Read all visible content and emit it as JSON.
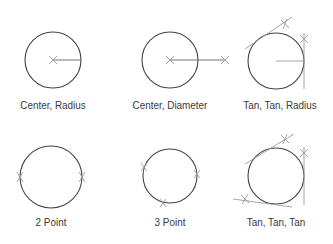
{
  "diagram": {
    "colors": {
      "circle": "#444444",
      "guide": "#9a9a9a",
      "text": "#3a3a3a"
    },
    "methods": [
      {
        "id": "center-radius",
        "label": "Center, Radius"
      },
      {
        "id": "center-diameter",
        "label": "Center, Diameter"
      },
      {
        "id": "tan-tan-radius",
        "label": "Tan, Tan, Radius"
      },
      {
        "id": "two-point",
        "label": "2 Point"
      },
      {
        "id": "three-point",
        "label": "3 Point"
      },
      {
        "id": "tan-tan-tan",
        "label": "Tan, Tan, Tan"
      }
    ]
  }
}
